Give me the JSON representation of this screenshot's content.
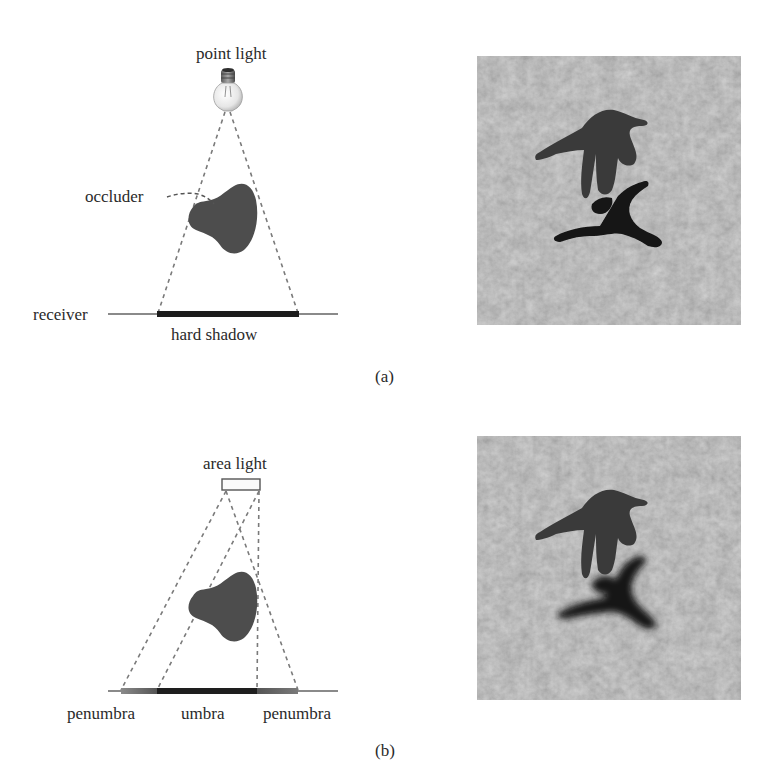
{
  "panel_a": {
    "light_label": "point light",
    "occluder_label": "occluder",
    "receiver_label": "receiver",
    "shadow_label": "hard shadow",
    "caption": "(a)",
    "icons": {
      "light": "light-bulb-icon"
    }
  },
  "panel_b": {
    "light_label": "area light",
    "penumbra_left_label": "penumbra",
    "umbra_label": "umbra",
    "penumbra_right_label": "penumbra",
    "caption": "(b)",
    "icons": {
      "light": "area-light-rectangle"
    }
  },
  "photos": [
    {
      "panel": "a",
      "description": "rendered character above textured ground casting a sharp-edged hard shadow"
    },
    {
      "panel": "b",
      "description": "rendered character above textured ground casting a soft-edged shadow with penumbra"
    }
  ],
  "colors": {
    "occluder": "#4a4a4a",
    "dashes": "#777777",
    "receiver_line": "#8a8a8a",
    "hard_shadow": "#1a1a1a",
    "umbra": "#1e1e1e",
    "penumbra": "#6a6a6a",
    "ground": "#9a9a9a"
  }
}
